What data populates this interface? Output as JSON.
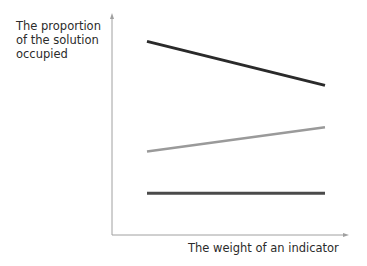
{
  "chart_data": {
    "type": "line",
    "title": "",
    "xlabel": "The weight of an indicator",
    "ylabel": "The proportion of the solution occupied",
    "ylabel_lines": [
      "The proportion",
      "of the solution",
      "occupied"
    ],
    "x": [
      0,
      1
    ],
    "series": [
      {
        "name": "decreasing",
        "color": "#2a2a2a",
        "values": [
          0.88,
          0.68
        ]
      },
      {
        "name": "increasing",
        "color": "#9a9a9a",
        "values": [
          0.38,
          0.49
        ]
      },
      {
        "name": "constant",
        "color": "#4a4a4a",
        "values": [
          0.19,
          0.19
        ]
      }
    ],
    "grid": false,
    "legend": "none"
  }
}
